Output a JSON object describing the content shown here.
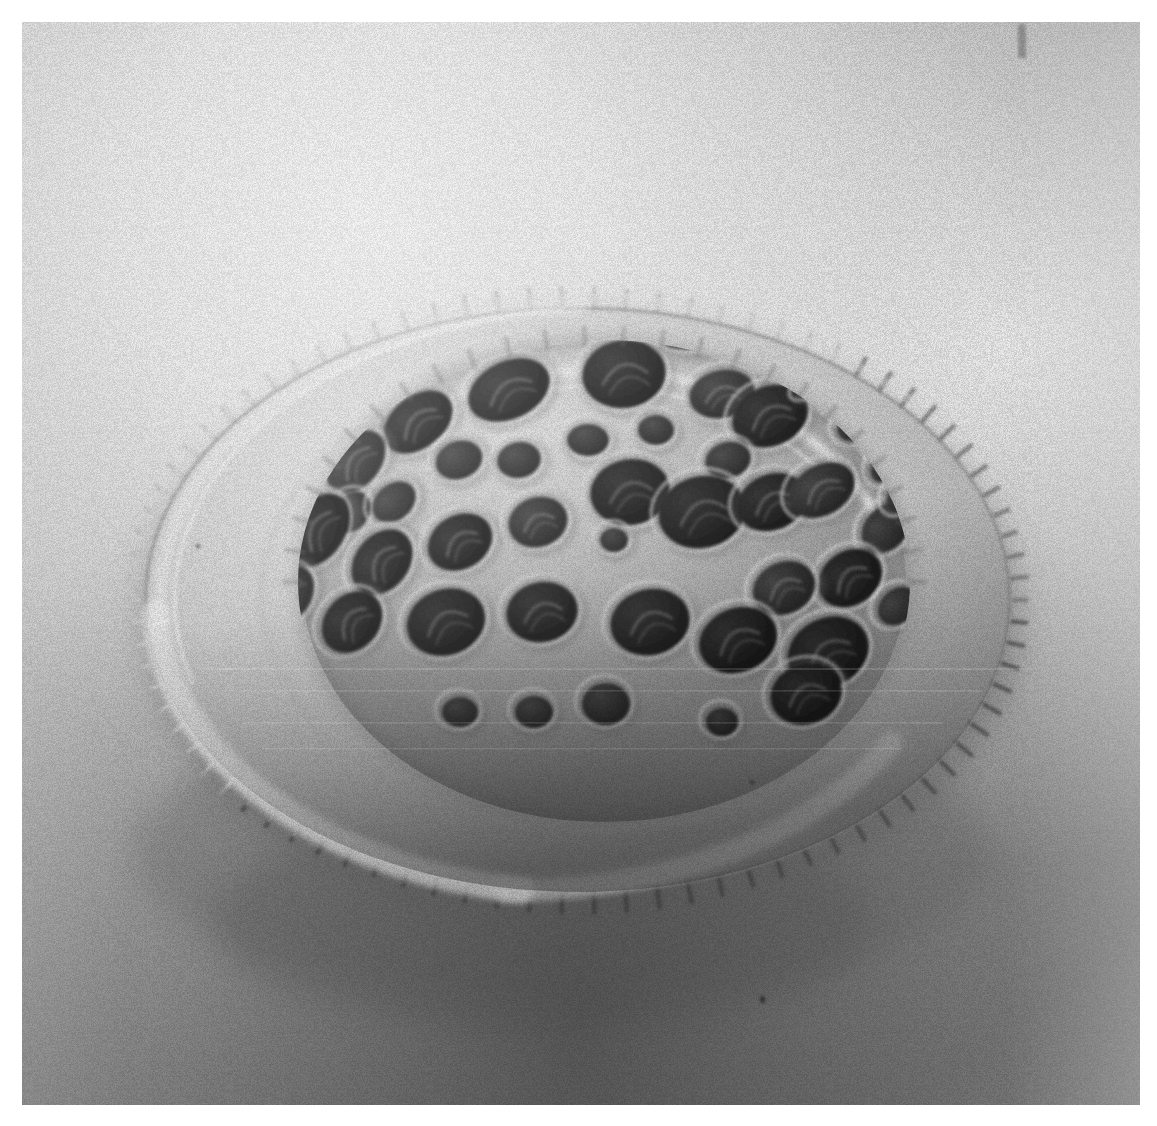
{
  "page": {
    "width": 1157,
    "height": 1126,
    "background_color": "#ffffff",
    "kind": "scanned-halftone-photograph"
  },
  "photo": {
    "name": "sem-micrograph-diatom-valve",
    "subject": "Scanning electron micrograph of a perforated silica diatom valve (dome with serrated marginal flange)",
    "frame": {
      "x": 22,
      "y": 22,
      "width": 1118,
      "height": 1083
    },
    "palette": {
      "paper_white": "#ffffff",
      "background_light": "#e8e8e8",
      "background_mid": "#b4b4b4",
      "background_shadow": "#8a8a8a",
      "background_dark": "#6e6e6e",
      "flange_highlight": "#f2f2f2",
      "flange_light": "#dcdcdc",
      "flange_mid": "#c0c0c0",
      "dome_light": "#d8d8d8",
      "dome_mid": "#a8a8a8",
      "dome_shade": "#8c8c8c",
      "pore_dark": "#3a3a3a",
      "pore_darkest": "#202020",
      "rim_edge": "#5a5a5a",
      "specular": "#fbfbfb"
    },
    "lighting": {
      "direction": "upper-left",
      "shadow_direction": "lower-right"
    },
    "marks": [
      {
        "name": "emulsion-scratch-top-right",
        "x": 1018,
        "y": 24,
        "width": 8,
        "height": 34
      },
      {
        "name": "dust-speck-lower-right",
        "x": 760,
        "y": 996,
        "width": 5,
        "height": 7
      },
      {
        "name": "dust-speck-left-flange",
        "x": 196,
        "y": 544,
        "width": 4,
        "height": 4
      },
      {
        "name": "dust-speck-right-flange",
        "x": 750,
        "y": 780,
        "width": 4,
        "height": 4
      }
    ],
    "structure": {
      "dome": {
        "name": "perforated-dome",
        "center_x": 582,
        "center_y": 560,
        "radius_x": 300,
        "radius_y": 235
      },
      "flange": {
        "name": "serrated-marginal-flange",
        "center_x": 578,
        "center_y": 590,
        "radius_x": 440,
        "radius_y": 300,
        "tooth_count": 86
      },
      "pores": [
        {
          "cx": 602,
          "cy": 352,
          "rx": 42,
          "ry": 34,
          "rot": -8,
          "tone": "pore_darkest"
        },
        {
          "cx": 487,
          "cy": 368,
          "rx": 43,
          "ry": 29,
          "rot": -25,
          "tone": "pore_darkest"
        },
        {
          "cx": 700,
          "cy": 372,
          "rx": 33,
          "ry": 24,
          "rot": -12,
          "tone": "pore_dark"
        },
        {
          "cx": 748,
          "cy": 394,
          "rx": 39,
          "ry": 30,
          "rot": -22,
          "tone": "pore_darkest"
        },
        {
          "cx": 672,
          "cy": 316,
          "rx": 31,
          "ry": 11,
          "rot": -6,
          "tone": "pore_dark"
        },
        {
          "cx": 760,
          "cy": 330,
          "rx": 26,
          "ry": 9,
          "rot": -24,
          "tone": "pore_dark"
        },
        {
          "cx": 795,
          "cy": 360,
          "rx": 24,
          "ry": 8,
          "rot": -34,
          "tone": "pore_dark"
        },
        {
          "cx": 396,
          "cy": 400,
          "rx": 39,
          "ry": 26,
          "rot": -38,
          "tone": "pore_darkest"
        },
        {
          "cx": 437,
          "cy": 438,
          "rx": 24,
          "ry": 19,
          "rot": -20,
          "tone": "pore_dark"
        },
        {
          "cx": 497,
          "cy": 438,
          "rx": 22,
          "ry": 18,
          "rot": -10,
          "tone": "pore_dark"
        },
        {
          "cx": 566,
          "cy": 418,
          "rx": 21,
          "ry": 16,
          "rot": 0,
          "tone": "pore_dark"
        },
        {
          "cx": 634,
          "cy": 408,
          "rx": 18,
          "ry": 15,
          "rot": 0,
          "tone": "pore_dark"
        },
        {
          "cx": 706,
          "cy": 438,
          "rx": 23,
          "ry": 18,
          "rot": -14,
          "tone": "pore_dark"
        },
        {
          "cx": 838,
          "cy": 398,
          "rx": 26,
          "ry": 18,
          "rot": -40,
          "tone": "pore_dark"
        },
        {
          "cx": 870,
          "cy": 440,
          "rx": 25,
          "ry": 17,
          "rot": -44,
          "tone": "pore_dark"
        },
        {
          "cx": 334,
          "cy": 440,
          "rx": 36,
          "ry": 24,
          "rot": -50,
          "tone": "pore_dark"
        },
        {
          "cx": 330,
          "cy": 490,
          "rx": 22,
          "ry": 17,
          "rot": -55,
          "tone": "pore_dark"
        },
        {
          "cx": 372,
          "cy": 480,
          "rx": 24,
          "ry": 18,
          "rot": -40,
          "tone": "pore_dark"
        },
        {
          "cx": 608,
          "cy": 470,
          "rx": 40,
          "ry": 33,
          "rot": -10,
          "tone": "pore_darkest"
        },
        {
          "cx": 680,
          "cy": 490,
          "rx": 44,
          "ry": 36,
          "rot": -14,
          "tone": "pore_darkest"
        },
        {
          "cx": 750,
          "cy": 480,
          "rx": 36,
          "ry": 28,
          "rot": -22,
          "tone": "pore_darkest"
        },
        {
          "cx": 800,
          "cy": 468,
          "rx": 35,
          "ry": 25,
          "rot": -30,
          "tone": "pore_dark"
        },
        {
          "cx": 296,
          "cy": 508,
          "rx": 40,
          "ry": 27,
          "rot": -58,
          "tone": "pore_darkest"
        },
        {
          "cx": 360,
          "cy": 540,
          "rx": 36,
          "ry": 27,
          "rot": -52,
          "tone": "pore_darkest"
        },
        {
          "cx": 438,
          "cy": 520,
          "rx": 34,
          "ry": 27,
          "rot": -30,
          "tone": "pore_darkest"
        },
        {
          "cx": 516,
          "cy": 500,
          "rx": 30,
          "ry": 25,
          "rot": -18,
          "tone": "pore_dark"
        },
        {
          "cx": 864,
          "cy": 506,
          "rx": 28,
          "ry": 21,
          "rot": -48,
          "tone": "pore_dark"
        },
        {
          "cx": 882,
          "cy": 470,
          "rx": 22,
          "ry": 14,
          "rot": -52,
          "tone": "pore_dark"
        },
        {
          "cx": 592,
          "cy": 518,
          "rx": 14,
          "ry": 12,
          "rot": 0,
          "tone": "pore_dark"
        },
        {
          "cx": 828,
          "cy": 556,
          "rx": 34,
          "ry": 27,
          "rot": -34,
          "tone": "pore_darkest"
        },
        {
          "cx": 762,
          "cy": 566,
          "rx": 32,
          "ry": 26,
          "rot": -24,
          "tone": "pore_dark"
        },
        {
          "cx": 268,
          "cy": 572,
          "rx": 30,
          "ry": 22,
          "rot": -62,
          "tone": "pore_dark"
        },
        {
          "cx": 330,
          "cy": 600,
          "rx": 34,
          "ry": 27,
          "rot": -48,
          "tone": "pore_darkest"
        },
        {
          "cx": 424,
          "cy": 600,
          "rx": 40,
          "ry": 33,
          "rot": -20,
          "tone": "pore_darkest"
        },
        {
          "cx": 520,
          "cy": 590,
          "rx": 36,
          "ry": 30,
          "rot": -12,
          "tone": "pore_darkest"
        },
        {
          "cx": 628,
          "cy": 600,
          "rx": 40,
          "ry": 33,
          "rot": -14,
          "tone": "pore_darkest"
        },
        {
          "cx": 716,
          "cy": 618,
          "rx": 40,
          "ry": 32,
          "rot": -22,
          "tone": "pore_darkest"
        },
        {
          "cx": 806,
          "cy": 630,
          "rx": 42,
          "ry": 34,
          "rot": -26,
          "tone": "pore_darkest"
        },
        {
          "cx": 876,
          "cy": 584,
          "rx": 22,
          "ry": 17,
          "rot": -40,
          "tone": "pore_dark"
        },
        {
          "cx": 252,
          "cy": 636,
          "rx": 24,
          "ry": 18,
          "rot": -60,
          "tone": "pore_dark"
        },
        {
          "cx": 438,
          "cy": 690,
          "rx": 18,
          "ry": 15,
          "rot": 0,
          "tone": "pore_dark"
        },
        {
          "cx": 512,
          "cy": 690,
          "rx": 19,
          "ry": 16,
          "rot": 0,
          "tone": "pore_dark"
        },
        {
          "cx": 584,
          "cy": 682,
          "rx": 24,
          "ry": 21,
          "rot": 0,
          "tone": "pore_dark"
        },
        {
          "cx": 700,
          "cy": 700,
          "rx": 16,
          "ry": 14,
          "rot": 0,
          "tone": "pore_dark"
        },
        {
          "cx": 784,
          "cy": 672,
          "rx": 36,
          "ry": 30,
          "rot": -18,
          "tone": "pore_darkest"
        }
      ]
    }
  }
}
